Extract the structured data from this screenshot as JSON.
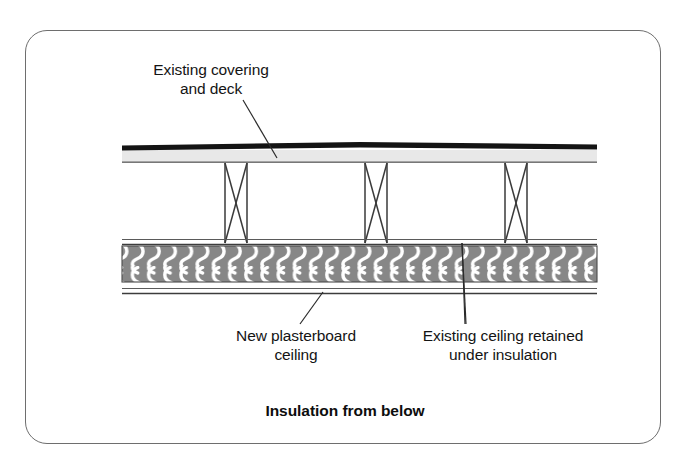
{
  "figure": {
    "caption": "Insulation from below",
    "border_color": "#6e6e6e",
    "background_color": "#ffffff"
  },
  "labels": {
    "covering_deck": "Existing covering\nand deck",
    "new_plasterboard_ceiling": "New plasterboard\nceiling",
    "existing_ceiling_retained": "Existing ceiling retained\nunder insulation"
  },
  "diagram": {
    "layers": [
      {
        "name": "existing-covering",
        "description": "Existing roof covering — solid dark band at top",
        "color": "#1a1a1a"
      },
      {
        "name": "existing-deck",
        "description": "Existing deck — light grey band beneath covering",
        "color": "#e6e6e6"
      },
      {
        "name": "joist-void",
        "description": "Void between deck and ceiling containing joists",
        "color": "#ffffff"
      },
      {
        "name": "insulation",
        "description": "Insulation quilt shown with looped hatching",
        "color": "#878787"
      },
      {
        "name": "existing-ceiling",
        "description": "Existing ceiling retained directly above insulation",
        "color": "#555555"
      },
      {
        "name": "new-plasterboard-ceiling",
        "description": "New plasterboard ceiling — thin double line below insulation",
        "color": "#555555"
      }
    ],
    "joists": {
      "count": 3,
      "description": "Timber joists drawn in section with X cross-bracing",
      "positions_x": [
        225,
        365,
        505
      ],
      "width": 22,
      "top_y": 163,
      "bottom_y": 243
    },
    "leaders": [
      {
        "name": "leader-covering-deck",
        "from_label": "covering_deck",
        "points_to": "existing covering and deck band"
      },
      {
        "name": "leader-new-plasterboard-ceiling",
        "from_label": "new_plasterboard_ceiling",
        "points_to": "new plasterboard ceiling line"
      },
      {
        "name": "leader-existing-ceiling",
        "from_label": "existing_ceiling_retained",
        "points_to": "existing ceiling above insulation"
      }
    ]
  }
}
